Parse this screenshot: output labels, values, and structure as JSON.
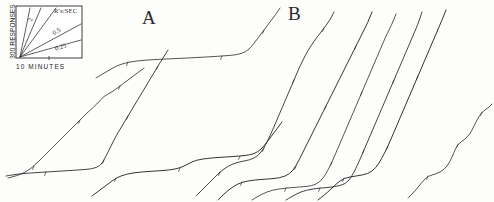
{
  "figure": {
    "background_color": "#fdfdfc",
    "ink_color": "#2b2b2b"
  },
  "legend": {
    "name": "rate-calibration-inset",
    "y_axis_label": "300 RESPONSES",
    "x_axis_label": "10 MINUTES",
    "units_label": "R's/SEC",
    "rate_lines": [
      {
        "label": "2",
        "value": 2
      },
      {
        "label": "0.5",
        "value": 0.5
      },
      {
        "label": "0.25",
        "value": 0.25
      }
    ]
  },
  "panels": [
    {
      "id": "A",
      "label": "A"
    },
    {
      "id": "B",
      "label": "B"
    }
  ],
  "chart_data": {
    "type": "line",
    "xlabel": "10 MINUTES",
    "ylabel": "300 RESPONSES",
    "grid": false,
    "legend_position": "top-left-inset",
    "annotations": [
      "A",
      "B"
    ],
    "calibration_rates": [
      2,
      0.5,
      0.25
    ],
    "calibration_units": "R's/SEC",
    "series": [
      {
        "name": "A-record-1",
        "panel": "A",
        "points": [
          [
            8,
            178
          ],
          [
            16,
            176
          ],
          [
            26,
            172
          ],
          [
            34,
            166
          ],
          [
            44,
            156
          ],
          [
            52,
            148
          ],
          [
            62,
            138
          ],
          [
            70,
            130
          ],
          [
            80,
            120
          ],
          [
            88,
            112
          ],
          [
            97,
            104
          ],
          [
            104,
            96
          ],
          [
            112,
            92
          ],
          [
            120,
            86
          ],
          [
            128,
            80
          ],
          [
            136,
            74
          ],
          [
            144,
            68
          ]
        ]
      },
      {
        "name": "A-record-2",
        "panel": "A",
        "points": [
          [
            6,
            176
          ],
          [
            18,
            174
          ],
          [
            30,
            173
          ],
          [
            46,
            172
          ],
          [
            62,
            171
          ],
          [
            78,
            170
          ],
          [
            92,
            169
          ],
          [
            100,
            166
          ],
          [
            104,
            160
          ],
          [
            108,
            152
          ],
          [
            112,
            144
          ],
          [
            116,
            136
          ],
          [
            122,
            126
          ],
          [
            128,
            116
          ],
          [
            134,
            106
          ],
          [
            140,
            96
          ],
          [
            146,
            86
          ],
          [
            152,
            76
          ],
          [
            158,
            66
          ],
          [
            163,
            58
          ],
          [
            168,
            50
          ]
        ]
      },
      {
        "name": "A-record-3",
        "panel": "A",
        "points": [
          [
            92,
            196
          ],
          [
            100,
            190
          ],
          [
            108,
            184
          ],
          [
            116,
            178
          ],
          [
            126,
            174
          ],
          [
            140,
            172
          ],
          [
            156,
            171
          ],
          [
            170,
            170
          ],
          [
            180,
            168
          ],
          [
            188,
            164
          ],
          [
            196,
            160
          ],
          [
            210,
            158
          ],
          [
            226,
            157
          ],
          [
            240,
            156
          ],
          [
            250,
            155
          ],
          [
            258,
            152
          ],
          [
            264,
            146
          ],
          [
            270,
            138
          ],
          [
            276,
            130
          ],
          [
            282,
            122
          ]
        ]
      },
      {
        "name": "A-record-4",
        "panel": "A",
        "points": [
          [
            96,
            78
          ],
          [
            106,
            72
          ],
          [
            116,
            66
          ],
          [
            128,
            62
          ],
          [
            146,
            60
          ],
          [
            166,
            59
          ],
          [
            188,
            58
          ],
          [
            206,
            57
          ],
          [
            222,
            56
          ],
          [
            236,
            55
          ],
          [
            246,
            52
          ],
          [
            252,
            46
          ],
          [
            258,
            38
          ],
          [
            264,
            30
          ],
          [
            270,
            22
          ],
          [
            276,
            14
          ],
          [
            280,
            8
          ]
        ]
      },
      {
        "name": "B-record-1",
        "panel": "B",
        "points": [
          [
            196,
            196
          ],
          [
            204,
            188
          ],
          [
            212,
            180
          ],
          [
            220,
            172
          ],
          [
            228,
            166
          ],
          [
            238,
            162
          ],
          [
            250,
            160
          ],
          [
            258,
            156
          ],
          [
            264,
            148
          ],
          [
            270,
            136
          ],
          [
            276,
            122
          ],
          [
            282,
            108
          ],
          [
            288,
            94
          ],
          [
            294,
            80
          ],
          [
            300,
            66
          ],
          [
            306,
            54
          ],
          [
            312,
            44
          ],
          [
            318,
            36
          ],
          [
            324,
            28
          ],
          [
            330,
            20
          ],
          [
            334,
            12
          ]
        ]
      },
      {
        "name": "B-record-2",
        "panel": "B",
        "points": [
          [
            218,
            200
          ],
          [
            226,
            192
          ],
          [
            234,
            186
          ],
          [
            242,
            182
          ],
          [
            254,
            180
          ],
          [
            268,
            179
          ],
          [
            280,
            178
          ],
          [
            290,
            174
          ],
          [
            296,
            166
          ],
          [
            302,
            154
          ],
          [
            308,
            142
          ],
          [
            314,
            130
          ],
          [
            320,
            118
          ],
          [
            326,
            106
          ],
          [
            332,
            94
          ],
          [
            338,
            82
          ],
          [
            344,
            70
          ],
          [
            350,
            58
          ],
          [
            356,
            46
          ],
          [
            362,
            34
          ],
          [
            368,
            22
          ],
          [
            372,
            12
          ]
        ]
      },
      {
        "name": "B-record-3",
        "panel": "B",
        "points": [
          [
            252,
            200
          ],
          [
            262,
            194
          ],
          [
            272,
            190
          ],
          [
            286,
            188
          ],
          [
            300,
            187
          ],
          [
            312,
            186
          ],
          [
            320,
            182
          ],
          [
            326,
            174
          ],
          [
            332,
            162
          ],
          [
            338,
            148
          ],
          [
            344,
            134
          ],
          [
            350,
            120
          ],
          [
            356,
            106
          ],
          [
            362,
            92
          ],
          [
            368,
            78
          ],
          [
            374,
            64
          ],
          [
            380,
            50
          ],
          [
            386,
            36
          ],
          [
            392,
            24
          ],
          [
            396,
            14
          ]
        ]
      },
      {
        "name": "B-record-4",
        "panel": "B",
        "points": [
          [
            286,
            200
          ],
          [
            296,
            194
          ],
          [
            306,
            190
          ],
          [
            320,
            188
          ],
          [
            334,
            187
          ],
          [
            346,
            184
          ],
          [
            352,
            176
          ],
          [
            358,
            164
          ],
          [
            364,
            150
          ],
          [
            370,
            136
          ],
          [
            376,
            122
          ],
          [
            382,
            108
          ],
          [
            388,
            94
          ],
          [
            394,
            80
          ],
          [
            400,
            66
          ],
          [
            406,
            52
          ],
          [
            412,
            38
          ],
          [
            418,
            24
          ],
          [
            422,
            12
          ]
        ]
      },
      {
        "name": "B-record-5",
        "panel": "B",
        "points": [
          [
            318,
            200
          ],
          [
            328,
            192
          ],
          [
            336,
            184
          ],
          [
            344,
            178
          ],
          [
            356,
            176
          ],
          [
            368,
            174
          ],
          [
            376,
            168
          ],
          [
            382,
            158
          ],
          [
            388,
            146
          ],
          [
            394,
            132
          ],
          [
            400,
            118
          ],
          [
            406,
            104
          ],
          [
            412,
            90
          ],
          [
            418,
            76
          ],
          [
            424,
            62
          ],
          [
            430,
            48
          ],
          [
            436,
            34
          ],
          [
            442,
            20
          ],
          [
            446,
            10
          ]
        ]
      },
      {
        "name": "B-record-6",
        "panel": "B",
        "points": [
          [
            408,
            198
          ],
          [
            416,
            190
          ],
          [
            422,
            182
          ],
          [
            428,
            176
          ],
          [
            436,
            174
          ],
          [
            444,
            170
          ],
          [
            450,
            162
          ],
          [
            454,
            152
          ],
          [
            458,
            144
          ],
          [
            464,
            140
          ],
          [
            470,
            134
          ],
          [
            474,
            126
          ],
          [
            478,
            118
          ],
          [
            482,
            112
          ],
          [
            488,
            108
          ],
          [
            492,
            104
          ]
        ]
      }
    ]
  }
}
